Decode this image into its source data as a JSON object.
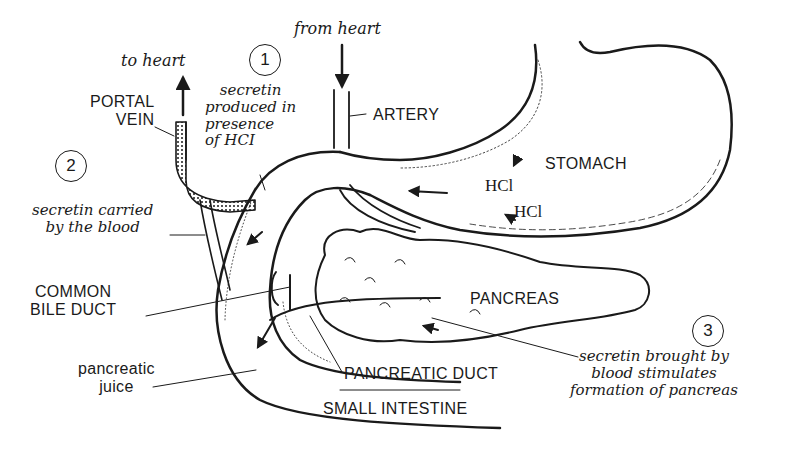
{
  "diagram": {
    "organs": {
      "stomach": "STOMACH",
      "pancreas": "PANCREAS",
      "small_intestine": "SMALL INTESTINE"
    },
    "vessels": {
      "portal_vein": [
        "PORTAL",
        "VEIN"
      ],
      "artery": "ARTERY",
      "to_heart": "to heart",
      "from_heart": "from heart"
    },
    "ducts": {
      "common_bile_duct": [
        "COMMON",
        "BILE DUCT"
      ],
      "pancreatic_duct": "PANCREATIC DUCT",
      "pancreatic_juice": [
        "pancreatic",
        "juice"
      ]
    },
    "chemicals": {
      "hcl_1": "HCl",
      "hcl_2": "HCl"
    },
    "steps": [
      {
        "number": "1",
        "lines": [
          "secretin",
          "produced in",
          "presence",
          "of HCI"
        ]
      },
      {
        "number": "2",
        "lines": [
          "secretin carried",
          "by the blood"
        ]
      },
      {
        "number": "3",
        "lines": [
          "secretin brought by",
          "blood stimulates",
          "formation of pancreas"
        ]
      }
    ],
    "colors": {
      "ink": "#1a1a1a",
      "background": "#ffffff"
    }
  }
}
